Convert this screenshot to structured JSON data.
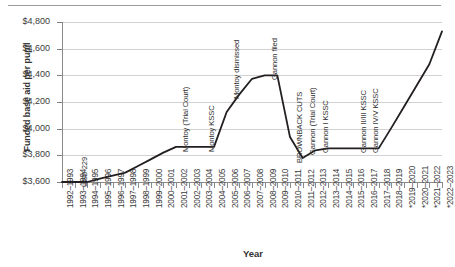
{
  "chart_data": {
    "type": "line",
    "title": "",
    "xlabel": "Year",
    "ylabel": "Funded base aid per pupil",
    "ylim": [
      3600,
      4800
    ],
    "ytick_values": [
      3600,
      3800,
      4000,
      4200,
      4400,
      4600,
      4800
    ],
    "ytick_labels": [
      "$3,600",
      "$3,800",
      "$4,000",
      "$4,200",
      "$4,400",
      "$4,600",
      "$4,800"
    ],
    "grid": true,
    "legend": "none",
    "line_color": "#231f20",
    "categories": [
      "1992–1993",
      "1993–1994",
      "1994–1995",
      "1995–1996",
      "1996–1997",
      "1997–1998",
      "1998–1999",
      "1999–2000",
      "2000–2001",
      "2001–2002",
      "2002–2003",
      "2003–2004",
      "2004–2005",
      "2005–2006",
      "2006–2007",
      "2007–2008",
      "2008–2009",
      "2009–2010",
      "2010–2011",
      "2011–2012",
      "2012–2013",
      "2013–2014",
      "2014–2015",
      "2015–2016",
      "2016–2017",
      "2017–2018",
      "2018–2019",
      "*2019–2020",
      "*2020–2021",
      "*2021–2022",
      "*2022–2023"
    ],
    "values": [
      3600,
      3600,
      3600,
      3626,
      3648,
      3670,
      3720,
      3770,
      3820,
      3863,
      3863,
      3863,
      3863,
      4125,
      4257,
      4374,
      4400,
      4400,
      3937,
      3780,
      3838,
      3852,
      3852,
      3852,
      3852,
      3852,
      4006,
      4165,
      4324,
      4483,
      4730
    ],
    "annotations": [
      {
        "label": "USD 229",
        "category": "1994–1995"
      },
      {
        "label": "Montoy (Trial Court)",
        "category": "2002–2003"
      },
      {
        "label": "Montoy KSSC",
        "category": "2004–2005"
      },
      {
        "label": "Montoy dismissed",
        "category": "2006–2007"
      },
      {
        "label": "Gannon filed",
        "category": "2009–2010"
      },
      {
        "label": "BROWNBACK CUTS",
        "category": "2011–2012"
      },
      {
        "label": "Gannon (Trial Court)",
        "category": "2012–2013"
      },
      {
        "label": "Gannon I KSSC",
        "category": "2013–2014"
      },
      {
        "label": "Gannon II/III KSSC",
        "category": "2016–2017"
      },
      {
        "label": "Gannon IV/V KSSC",
        "category": "2017–2018"
      }
    ]
  }
}
